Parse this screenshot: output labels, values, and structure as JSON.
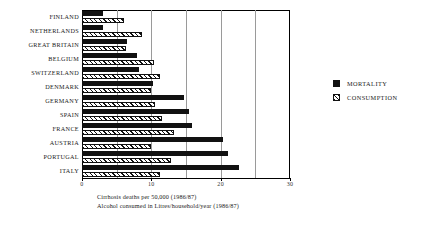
{
  "chart_data": {
    "type": "bar",
    "orientation": "horizontal",
    "title": "",
    "xlabel": "",
    "ylabel": "",
    "xlim": [
      0,
      30
    ],
    "xticks": [
      0,
      10,
      20,
      30
    ],
    "xtick_labels": [
      "0",
      "10",
      "20",
      "30"
    ],
    "gridlines": [
      0,
      5,
      10,
      15,
      20,
      25,
      30
    ],
    "grid": true,
    "legend_position": "right",
    "categories": [
      "FINLAND",
      "NETHERLANDS",
      "GREAT BRITAIN",
      "BELGIUM",
      "SWITZERLAND",
      "DENMARK",
      "GERMANY",
      "SPAIN",
      "FRANCE",
      "AUSTRIA",
      "PORTUGAL",
      "ITALY"
    ],
    "series": [
      {
        "name": "MORTALITY",
        "style": "solid-black",
        "values": [
          3.0,
          3.1,
          6.5,
          7.9,
          8.2,
          10.3,
          14.7,
          15.5,
          15.9,
          20.4,
          21.1,
          22.7
        ]
      },
      {
        "name": "CONSUMPTION",
        "style": "hatched",
        "values": [
          6.0,
          8.6,
          6.4,
          10.4,
          11.2,
          10.0,
          10.5,
          11.5,
          13.2,
          9.9,
          12.8,
          11.3
        ]
      }
    ]
  },
  "legend": {
    "items": [
      {
        "label": "MORTALITY"
      },
      {
        "label": "CONSUMPTION"
      }
    ]
  },
  "caption": {
    "line1": "Cirrhosis deaths per 50,000  (1986/87)",
    "line2": "Alcohol consumed in Litres/household/year (1986/87)"
  }
}
